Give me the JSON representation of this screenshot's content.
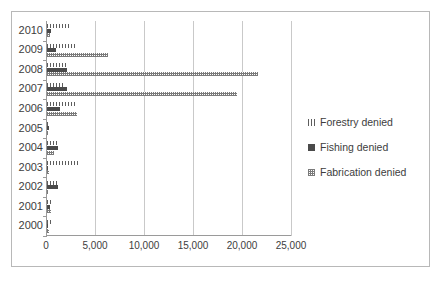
{
  "chart_data": {
    "type": "bar",
    "orientation": "horizontal",
    "title": "",
    "xlabel": "",
    "ylabel": "",
    "xlim": [
      0,
      25000
    ],
    "ylim": null,
    "grid": true,
    "legend_position": "right",
    "categories": [
      "2010",
      "2009",
      "2008",
      "2007",
      "2006",
      "2005",
      "2004",
      "2003",
      "2002",
      "2001",
      "2000"
    ],
    "xticks": [
      0,
      5000,
      10000,
      15000,
      20000,
      25000
    ],
    "xticklabels": [
      "0",
      "5,000",
      "10,000",
      "15,000",
      "20,000",
      "25,000"
    ],
    "series": [
      {
        "name": "Forestry denied",
        "pattern": "vertical-line-hatch",
        "color": "#5d5d5d",
        "values": [
          2300,
          3000,
          2100,
          1600,
          2900,
          180,
          1100,
          3300,
          1000,
          380,
          600
        ]
      },
      {
        "name": "Fishing denied",
        "pattern": "solid",
        "color": "#4a4a4a",
        "values": [
          450,
          900,
          2000,
          2000,
          1300,
          220,
          1100,
          150,
          1100,
          300,
          120
        ]
      },
      {
        "name": "Fabrication denied",
        "pattern": "checker-hatch",
        "color": "#7a7a7a",
        "values": [
          300,
          6200,
          21500,
          19400,
          3100,
          60,
          700,
          250,
          150,
          400,
          250
        ]
      }
    ]
  },
  "legend": {
    "entries": [
      {
        "label": "Forestry denied"
      },
      {
        "label": "Fishing denied"
      },
      {
        "label": "Fabrication denied"
      }
    ]
  }
}
